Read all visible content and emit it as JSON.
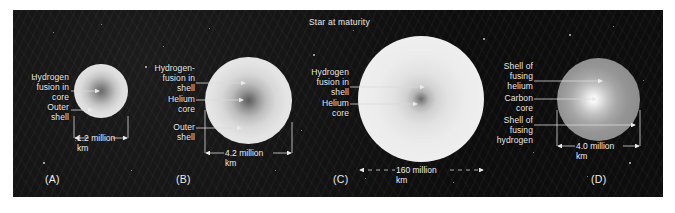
{
  "figure": {
    "title": "Star at maturity",
    "background_color": "#0a0a0a",
    "text_color": "#e9e9e9"
  },
  "panels": [
    {
      "letter": "(A)",
      "labels": [
        {
          "id": "a-core",
          "text": "Hydrogen\nfusion in\ncore"
        },
        {
          "id": "a-shell",
          "text": "Outer\nshell"
        }
      ],
      "measure": {
        "text": "1.2 million\nkm",
        "style": "solid"
      }
    },
    {
      "letter": "(B)",
      "labels": [
        {
          "id": "b-shellfusion",
          "text": "Hydrogen-\nfusion in\nshell"
        },
        {
          "id": "b-hecore",
          "text": "Helium\ncore"
        },
        {
          "id": "b-outershell",
          "text": "Outer\nshell"
        }
      ],
      "measure": {
        "text": "4.2 million\nkm",
        "style": "solid"
      }
    },
    {
      "letter": "(C)",
      "labels": [
        {
          "id": "c-shellfusion",
          "text": "Hydrogen\nfusion in\nshell"
        },
        {
          "id": "c-hecore",
          "text": "Helium\ncore"
        }
      ],
      "measure": {
        "text": "160 million\nkm",
        "style": "dashed"
      }
    },
    {
      "letter": "(D)",
      "labels": [
        {
          "id": "d-heshell",
          "text": "Shell of\nfusing\nhelium"
        },
        {
          "id": "d-ccore",
          "text": "Carbon\ncore"
        },
        {
          "id": "d-hshell",
          "text": "Shell of\nfusing\nhydrogen"
        }
      ],
      "measure": {
        "text": "4.0 million\nkm",
        "style": "solid"
      }
    }
  ]
}
